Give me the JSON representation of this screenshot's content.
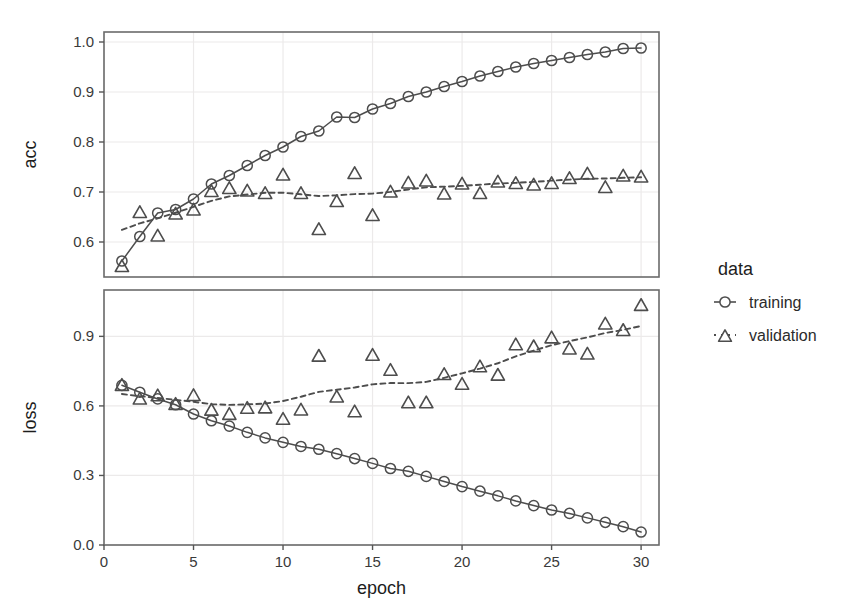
{
  "chart_data": {
    "type": "line",
    "title": "",
    "xlabel": "epoch",
    "x": [
      1,
      2,
      3,
      4,
      5,
      6,
      7,
      8,
      9,
      10,
      11,
      12,
      13,
      14,
      15,
      16,
      17,
      18,
      19,
      20,
      21,
      22,
      23,
      24,
      25,
      26,
      27,
      28,
      29,
      30
    ],
    "xlim": [
      0,
      31
    ],
    "xticks": [
      0,
      5,
      10,
      15,
      20,
      25,
      30
    ],
    "xticklabels": [
      "0",
      "5",
      "10",
      "15",
      "20",
      "25",
      "30"
    ],
    "grid": true,
    "legend": {
      "title": "data",
      "position": "right",
      "entries": [
        {
          "name": "training",
          "marker": "circle",
          "line": "solid"
        },
        {
          "name": "validation",
          "marker": "triangle",
          "line": "dashed"
        }
      ]
    },
    "panels": [
      {
        "ylabel": "acc",
        "ylim": [
          0.53,
          1.02
        ],
        "yticks": [
          0.6,
          0.7,
          0.8,
          0.9,
          1.0
        ],
        "yticklabels": [
          "0.6",
          "0.7",
          "0.8",
          "0.9",
          "1.0"
        ],
        "series": [
          {
            "name": "training",
            "marker": "circle",
            "line": "solid",
            "values": [
              0.562,
              0.611,
              0.658,
              0.665,
              0.686,
              0.716,
              0.733,
              0.753,
              0.773,
              0.79,
              0.811,
              0.822,
              0.85,
              0.849,
              0.866,
              0.877,
              0.891,
              0.9,
              0.911,
              0.921,
              0.932,
              0.941,
              0.95,
              0.957,
              0.963,
              0.969,
              0.975,
              0.98,
              0.987,
              0.988
            ]
          },
          {
            "name": "validation",
            "marker": "triangle",
            "line": "dashed",
            "values": [
              0.554,
              0.662,
              0.615,
              0.659,
              0.667,
              0.704,
              0.71,
              0.705,
              0.7,
              0.737,
              0.7,
              0.628,
              0.684,
              0.74,
              0.656,
              0.703,
              0.721,
              0.725,
              0.699,
              0.719,
              0.7,
              0.723,
              0.72,
              0.717,
              0.72,
              0.73,
              0.739,
              0.712,
              0.735,
              0.733
            ]
          }
        ]
      },
      {
        "ylabel": "loss",
        "ylim": [
          0.0,
          1.1
        ],
        "yticks": [
          0.0,
          0.3,
          0.6,
          0.9
        ],
        "yticklabels": [
          "0.0",
          "0.3",
          "0.6",
          "0.9"
        ],
        "series": [
          {
            "name": "training",
            "marker": "circle",
            "line": "solid",
            "values": [
              0.689,
              0.659,
              0.63,
              0.605,
              0.565,
              0.536,
              0.513,
              0.486,
              0.462,
              0.443,
              0.425,
              0.413,
              0.394,
              0.373,
              0.352,
              0.33,
              0.318,
              0.296,
              0.274,
              0.252,
              0.232,
              0.212,
              0.19,
              0.17,
              0.151,
              0.136,
              0.117,
              0.098,
              0.079,
              0.056
            ]
          },
          {
            "name": "validation",
            "marker": "triangle",
            "line": "dashed",
            "values": [
              0.695,
              0.636,
              0.65,
              0.613,
              0.651,
              0.588,
              0.57,
              0.596,
              0.598,
              0.549,
              0.589,
              0.821,
              0.645,
              0.581,
              0.825,
              0.76,
              0.62,
              0.62,
              0.742,
              0.7,
              0.775,
              0.739,
              0.87,
              0.862,
              0.9,
              0.852,
              0.83,
              0.96,
              0.932,
              1.04
            ]
          }
        ]
      }
    ]
  }
}
